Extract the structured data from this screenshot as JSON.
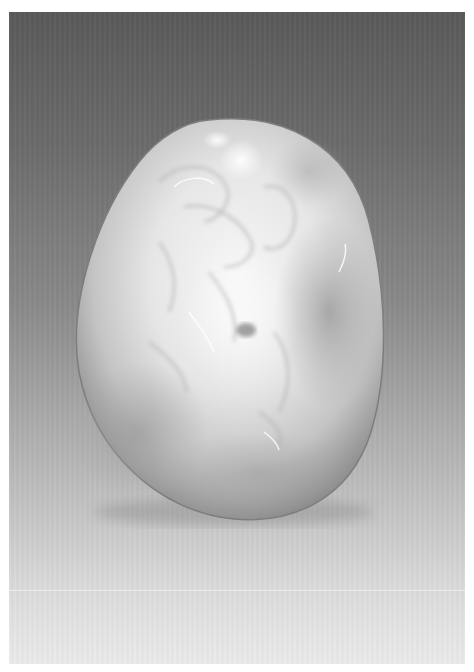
{
  "image": {
    "subject": "carved white jade pebble",
    "background": {
      "type": "vertical-gradient",
      "top_color": "#5a5a5a",
      "bottom_color": "#ebebeb",
      "border_color": "#ffffff"
    },
    "pebble": {
      "base_color": "#e4e4e4",
      "highlight_color": "#f8f8f8",
      "skin_color": "#8e8e8e",
      "shadow_color": "#6a6a6a"
    }
  }
}
